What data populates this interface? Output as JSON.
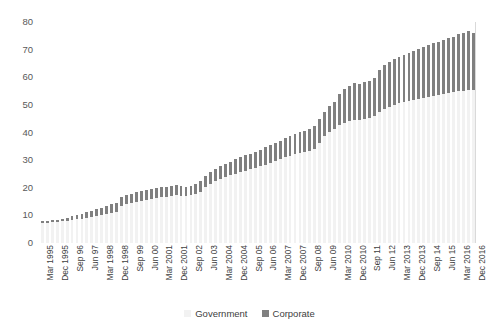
{
  "chart_data": {
    "type": "bar",
    "subtype": "stacked-column",
    "title": "",
    "xlabel": "",
    "ylabel": "",
    "ylim": [
      0,
      80
    ],
    "yticks": [
      0,
      10,
      20,
      30,
      40,
      50,
      60,
      70,
      80
    ],
    "grid": false,
    "legend_position": "bottom-center",
    "legend": [
      "Government",
      "Corporate"
    ],
    "colors": {
      "Government": "#f2f2f2",
      "Corporate": "#808080"
    },
    "categories": [
      "Mar 1995",
      "Jun 1995",
      "Sep 1995",
      "Dec 1995",
      "Mar 96",
      "Jun 96",
      "Sep 96",
      "Dec 96",
      "Mar 97",
      "Jun 97",
      "Sep 97",
      "Dec 97",
      "Mar 1998",
      "Jun 1998",
      "Sep 1998",
      "Dec 1998",
      "Mar 99",
      "Jun 99",
      "Sep 99",
      "Dec 99",
      "Mar 00",
      "Jun 00",
      "Sep 00",
      "Dec 00",
      "Mar 2001",
      "Jun 2001",
      "Sep 2001",
      "Dec 2001",
      "Mar 02",
      "Jun 02",
      "Sep 02",
      "Dec 02",
      "Mar 03",
      "Jun 03",
      "Sep 03",
      "Dec 03",
      "Mar 2004",
      "Jun 2004",
      "Sep 2004",
      "Dec 2004",
      "Mar 05",
      "Jun 05",
      "Sep 05",
      "Dec 05",
      "Mar 06",
      "Jun 06",
      "Sep 06",
      "Dec 06",
      "Mar 2007",
      "Jun 2007",
      "Sep 2007",
      "Dec 2007",
      "Mar 08",
      "Jun 08",
      "Sep 08",
      "Dec 08",
      "Mar 09",
      "Jun 09",
      "Sep 09",
      "Dec 09",
      "Mar 2010",
      "Jun 2010",
      "Sep 2010",
      "Dec 2010",
      "Mar 11",
      "Jun 11",
      "Sep 11",
      "Dec 11",
      "Mar 12",
      "Jun 12",
      "Sep 12",
      "Dec 12",
      "Mar 2013",
      "Jun 2013",
      "Sep 2013",
      "Dec 2013",
      "Mar 14",
      "Jun 14",
      "Sep 14",
      "Dec 14",
      "Mar 15",
      "Jun 15",
      "Sep 15",
      "Dec 15",
      "Mar 2016",
      "Jun 2016",
      "Sep 2016",
      "Dec 2016"
    ],
    "tick_labels_shown": [
      "Mar 1995",
      "Dec 1995",
      "Sep 96",
      "Jun 97",
      "Mar 1998",
      "Dec 1998",
      "Sep 99",
      "Jun 00",
      "Mar 2001",
      "Dec 2001",
      "Sep 02",
      "Jun 03",
      "Mar 2004",
      "Dec 2004",
      "Sep 05",
      "Jun 06",
      "Mar 2007",
      "Dec 2007",
      "Sep 08",
      "Jun 09",
      "Mar 2010",
      "Dec 2010",
      "Sep 11",
      "Jun 12",
      "Mar 2013",
      "Dec 2013",
      "Sep 14",
      "Jun 15",
      "Mar 2016",
      "Dec 2016"
    ],
    "tick_label_indices": [
      0,
      3,
      6,
      9,
      12,
      15,
      18,
      21,
      24,
      27,
      30,
      33,
      36,
      39,
      42,
      45,
      48,
      51,
      54,
      57,
      60,
      63,
      66,
      69,
      72,
      75,
      78,
      81,
      84,
      87
    ],
    "series": [
      {
        "name": "Government",
        "values": [
          7.4,
          7.4,
          7.5,
          7.6,
          7.8,
          8.0,
          8.3,
          8.6,
          8.8,
          9.2,
          9.5,
          9.8,
          10.2,
          10.6,
          11.0,
          11.4,
          13.4,
          14.0,
          14.4,
          14.8,
          15.2,
          15.6,
          15.9,
          16.2,
          16.5,
          16.8,
          17.2,
          17.4,
          17.2,
          17.0,
          17.3,
          17.6,
          18.6,
          20.2,
          21.4,
          22.3,
          23.2,
          23.9,
          24.5,
          25.1,
          25.7,
          26.2,
          26.7,
          27.2,
          27.8,
          28.4,
          29.0,
          29.6,
          30.3,
          31.0,
          31.6,
          32.2,
          32.6,
          32.9,
          33.4,
          34.0,
          36.2,
          38.6,
          40.1,
          41.4,
          42.6,
          43.4,
          44.0,
          44.6,
          44.5,
          44.8,
          45.2,
          45.8,
          47.3,
          48.6,
          49.4,
          50.1,
          50.6,
          51.0,
          51.4,
          51.8,
          52.2,
          52.6,
          53.0,
          53.3,
          53.6,
          53.9,
          54.2,
          54.5,
          54.9,
          55.2,
          55.5,
          55.3
        ]
      },
      {
        "name": "Corporate",
        "values": [
          0.6,
          0.7,
          0.8,
          0.9,
          1.0,
          1.2,
          1.4,
          1.6,
          1.8,
          2.0,
          2.2,
          2.4,
          2.6,
          2.8,
          3.0,
          3.2,
          3.4,
          3.5,
          3.5,
          3.5,
          3.6,
          3.6,
          3.6,
          3.6,
          3.6,
          3.6,
          3.5,
          3.5,
          3.4,
          3.3,
          3.4,
          3.6,
          3.8,
          4.0,
          4.2,
          4.4,
          4.6,
          4.8,
          5.0,
          5.2,
          5.3,
          5.5,
          5.6,
          5.8,
          6.0,
          6.2,
          6.4,
          6.6,
          6.8,
          7.0,
          7.2,
          7.4,
          7.6,
          7.8,
          8.0,
          8.2,
          8.6,
          9.0,
          9.4,
          9.8,
          11.4,
          12.2,
          12.8,
          13.3,
          13.2,
          13.4,
          13.6,
          13.8,
          15.2,
          15.8,
          16.2,
          16.6,
          16.9,
          17.2,
          17.5,
          17.8,
          18.1,
          18.4,
          18.7,
          19.0,
          19.3,
          19.6,
          19.9,
          20.2,
          20.6,
          20.9,
          21.2,
          20.6
        ]
      }
    ],
    "totals": [
      8.0,
      8.1,
      8.3,
      8.5,
      8.8,
      9.2,
      9.7,
      10.2,
      10.6,
      11.2,
      11.7,
      12.2,
      12.8,
      13.4,
      14.0,
      14.6,
      16.8,
      17.5,
      17.9,
      18.3,
      18.8,
      19.2,
      19.5,
      19.8,
      20.1,
      20.4,
      20.7,
      20.9,
      20.6,
      20.3,
      20.7,
      21.2,
      22.4,
      24.2,
      25.6,
      26.7,
      27.8,
      28.7,
      29.5,
      30.3,
      31.0,
      31.7,
      32.3,
      33.0,
      33.8,
      34.6,
      35.4,
      36.2,
      37.1,
      38.0,
      38.8,
      39.6,
      40.2,
      40.7,
      41.4,
      42.2,
      44.8,
      47.6,
      49.5,
      51.2,
      54.0,
      55.6,
      56.8,
      57.9,
      57.7,
      58.2,
      58.8,
      59.6,
      62.5,
      64.4,
      65.6,
      66.7,
      67.5,
      68.2,
      68.9,
      69.6,
      70.3,
      71.0,
      71.7,
      72.3,
      72.9,
      73.5,
      74.1,
      74.7,
      75.5,
      76.1,
      76.7,
      75.9
    ]
  }
}
